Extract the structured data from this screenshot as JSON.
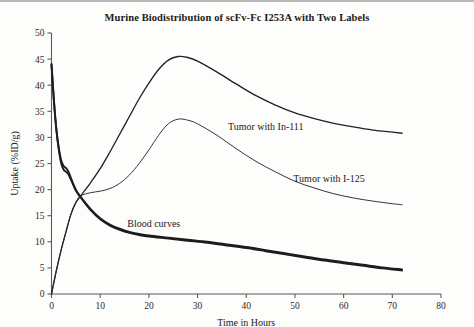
{
  "chart_data": {
    "type": "line",
    "title": "Murine Biodistribution of scFv-Fc I253A with Two Labels",
    "xlabel": "Time in Hours",
    "ylabel": "Uptake (%ID/g)",
    "xlim": [
      0,
      80
    ],
    "ylim": [
      0,
      50
    ],
    "xticks": [
      0,
      10,
      20,
      30,
      40,
      50,
      60,
      70,
      80
    ],
    "yticks": [
      0,
      5,
      10,
      15,
      20,
      25,
      30,
      35,
      40,
      45,
      50
    ],
    "grid": false,
    "legend": "inline-annotations",
    "annotations": [
      {
        "text": "Tumor with In-111",
        "x_hours": 44,
        "y_value": 31.5
      },
      {
        "text": "Tumor with I-125",
        "x_hours": 57,
        "y_value": 21.5
      },
      {
        "text": "Blood curves",
        "x_hours": 21,
        "y_value": 12.8
      }
    ],
    "series": [
      {
        "name": "Tumor with In-111",
        "x": [
          0,
          1,
          2,
          3,
          4,
          5,
          6,
          8,
          10,
          12,
          14,
          16,
          18,
          20,
          22,
          24,
          26,
          28,
          30,
          34,
          38,
          42,
          46,
          50,
          54,
          58,
          62,
          66,
          70,
          72
        ],
        "values": [
          0,
          4.5,
          8.5,
          12.0,
          15.3,
          17.5,
          18.8,
          21.3,
          24.0,
          27.2,
          30.6,
          34.0,
          37.4,
          40.4,
          43.0,
          44.8,
          45.5,
          45.3,
          44.6,
          42.5,
          40.2,
          38.0,
          36.2,
          34.7,
          33.6,
          32.7,
          32.0,
          31.4,
          31.0,
          30.8
        ]
      },
      {
        "name": "Tumor with I-125",
        "x": [
          0,
          1,
          2,
          3,
          4,
          5,
          6,
          8,
          10,
          12,
          14,
          16,
          18,
          20,
          22,
          24,
          26,
          28,
          30,
          34,
          38,
          42,
          46,
          50,
          54,
          58,
          62,
          66,
          70,
          72
        ],
        "values": [
          0,
          4.5,
          8.5,
          12.0,
          15.3,
          17.5,
          18.8,
          19.4,
          19.7,
          20.2,
          21.2,
          22.8,
          25.0,
          27.6,
          30.4,
          32.6,
          33.5,
          33.3,
          32.6,
          30.4,
          27.8,
          25.4,
          23.4,
          21.6,
          20.3,
          19.2,
          18.4,
          17.8,
          17.3,
          17.1
        ]
      },
      {
        "name": "Blood curve (In-111)",
        "x": [
          0,
          0.5,
          1,
          1.5,
          2,
          2.5,
          3,
          3.5,
          4,
          5,
          6,
          8,
          10,
          12,
          14,
          16,
          18,
          20,
          24,
          28,
          32,
          36,
          40,
          44,
          48,
          52,
          56,
          60,
          64,
          68,
          72
        ],
        "values": [
          44.0,
          37.0,
          31.5,
          28.0,
          25.6,
          24.5,
          24.1,
          23.4,
          22.2,
          20.0,
          18.6,
          16.3,
          14.5,
          13.3,
          12.5,
          11.9,
          11.5,
          11.2,
          10.8,
          10.4,
          10.0,
          9.5,
          9.0,
          8.4,
          7.8,
          7.2,
          6.6,
          6.1,
          5.6,
          5.1,
          4.7
        ]
      },
      {
        "name": "Blood curve (I-125)",
        "x": [
          0,
          0.5,
          1,
          1.5,
          2,
          2.5,
          3,
          3.5,
          4,
          5,
          6,
          8,
          10,
          12,
          14,
          16,
          18,
          20,
          24,
          28,
          32,
          36,
          40,
          44,
          48,
          52,
          56,
          60,
          64,
          68,
          72
        ],
        "values": [
          44.0,
          37.0,
          31.5,
          27.6,
          25.0,
          23.8,
          23.4,
          22.9,
          21.9,
          19.8,
          18.5,
          16.1,
          14.3,
          13.1,
          12.3,
          11.7,
          11.3,
          11.0,
          10.6,
          10.2,
          9.8,
          9.3,
          8.8,
          8.2,
          7.6,
          7.0,
          6.4,
          5.9,
          5.4,
          4.9,
          4.5
        ]
      }
    ]
  }
}
